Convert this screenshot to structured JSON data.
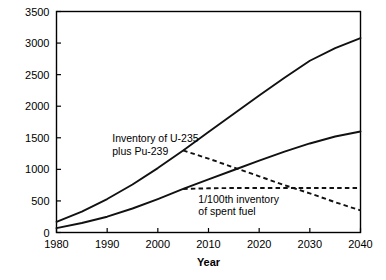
{
  "chart_data": {
    "type": "line",
    "title": "",
    "xlabel": "Year",
    "ylabel": "Inventory (tons)",
    "xlim": [
      1980,
      2040
    ],
    "ylim": [
      0,
      3500
    ],
    "xticks": [
      1980,
      1990,
      2000,
      2010,
      2020,
      2030,
      2040
    ],
    "xtick_labels": [
      "1980",
      "1990",
      "2000",
      "2010",
      "2020",
      "2030",
      "2040"
    ],
    "yticks": [
      0,
      500,
      1000,
      1500,
      2000,
      2500,
      3000,
      3500
    ],
    "ytick_labels": [
      "0",
      "500",
      "1000",
      "1500",
      "2000",
      "2500",
      "3000",
      "3500"
    ],
    "grid": false,
    "legend": "none",
    "annotations": [
      {
        "name": "fissile-inventory-label",
        "line1": "Inventory of U-235",
        "line2": "plus Pu-239",
        "x": 1991,
        "y": 1430
      },
      {
        "name": "spent-fuel-label",
        "line1": "1/100th inventory",
        "line2": "of spent fuel",
        "x": 2008,
        "y": 470
      }
    ],
    "series": [
      {
        "name": "Inventory of U-235 plus Pu-239 (continued growth)",
        "style": "solid",
        "x": [
          1980,
          1985,
          1990,
          1995,
          2000,
          2005,
          2010,
          2015,
          2020,
          2025,
          2030,
          2035,
          2040
        ],
        "values": [
          170,
          330,
          530,
          760,
          1020,
          1300,
          1590,
          1880,
          2170,
          2450,
          2720,
          2920,
          3080
        ]
      },
      {
        "name": "1/100th inventory of spent fuel (continued growth)",
        "style": "solid",
        "x": [
          1980,
          1985,
          1990,
          1995,
          2000,
          2005,
          2010,
          2015,
          2020,
          2025,
          2030,
          2035,
          2040
        ],
        "values": [
          70,
          150,
          250,
          380,
          530,
          690,
          840,
          990,
          1140,
          1280,
          1410,
          1520,
          1600
        ]
      },
      {
        "name": "Inventory of U-235 plus Pu-239 (phase-out scenario)",
        "style": "dashed",
        "x": [
          2005,
          2010,
          2015,
          2020,
          2025,
          2030,
          2035,
          2040
        ],
        "values": [
          1300,
          1170,
          1030,
          890,
          750,
          620,
          480,
          350
        ]
      },
      {
        "name": "1/100th inventory of spent fuel (phase-out scenario)",
        "style": "dashed",
        "x": [
          2005,
          2010,
          2015,
          2020,
          2025,
          2030,
          2035,
          2040
        ],
        "values": [
          690,
          700,
          705,
          705,
          705,
          705,
          705,
          705
        ]
      }
    ]
  }
}
